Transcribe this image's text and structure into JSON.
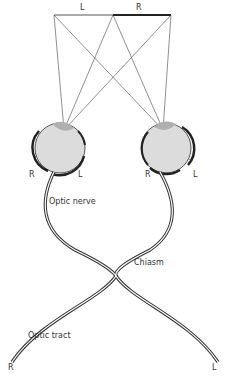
{
  "diagram": {
    "visual_field": {
      "left_label": "L",
      "right_label": "R",
      "left_color": "#aaaaaa",
      "right_color": "#222222"
    },
    "left_eye": {
      "retina_left_label": "R",
      "retina_right_label": "L"
    },
    "right_eye": {
      "retina_left_label": "R",
      "retina_right_label": "L"
    },
    "labels": {
      "optic_nerve": "Optic nerve",
      "chiasm": "Chiasm",
      "optic_tract": "Optic tract",
      "tract_end_left": "R",
      "tract_end_right": "L"
    },
    "colors": {
      "eye_fill": "#dcdcdc",
      "lens_fill": "#b0b0b0",
      "nerve_stroke": "#333333",
      "ray_stroke": "#444444"
    }
  }
}
